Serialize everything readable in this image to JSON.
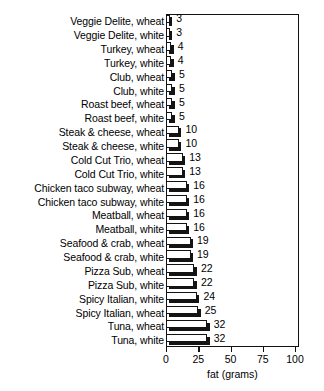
{
  "chart_data": {
    "type": "bar",
    "orientation": "horizontal",
    "title": "",
    "xlabel": "fat (grams)",
    "ylabel": "",
    "xlim": [
      0,
      100
    ],
    "xticks": [
      0,
      25,
      50,
      75,
      100
    ],
    "xtick_labels": [
      "0",
      "25",
      "50",
      "75",
      "100"
    ],
    "grid": false,
    "legend": null,
    "categories": [
      "Veggie Delite, wheat",
      "Veggie Delite, white",
      "Turkey, wheat",
      "Turkey, white",
      "Club, wheat",
      "Club, white",
      "Roast beef, wheat",
      "Roast beef, white",
      "Steak & cheese, wheat",
      "Steak & cheese, white",
      "Cold Cut Trio, wheat",
      "Cold Cut Trio, white",
      "Chicken taco subway, wheat",
      "Chicken taco subway, white",
      "Meatball, wheat",
      "Meatball, white",
      "Seafood & crab, wheat",
      "Seafood & crab, white",
      "Pizza Sub, wheat",
      "Pizza Sub, white",
      "Spicy Italian, white",
      "Spicy Italian, wheat",
      "Tuna, wheat",
      "Tuna, white"
    ],
    "values": [
      3,
      3,
      4,
      4,
      5,
      5,
      5,
      5,
      10,
      10,
      13,
      13,
      16,
      16,
      16,
      16,
      19,
      19,
      22,
      22,
      24,
      25,
      32,
      32
    ],
    "value_labels": [
      "3",
      "3",
      "4",
      "4",
      "5",
      "5",
      "5",
      "5",
      "10",
      "10",
      "13",
      "13",
      "16",
      "16",
      "16",
      "16",
      "19",
      "19",
      "22",
      "22",
      "24",
      "25",
      "32",
      "32"
    ],
    "colors": {
      "bar_face": "#ffffff",
      "bar_outline": "#131313",
      "bar_shadow": "#141414",
      "axis": "#111111",
      "text": "#000000",
      "background": "#ffffff"
    }
  }
}
